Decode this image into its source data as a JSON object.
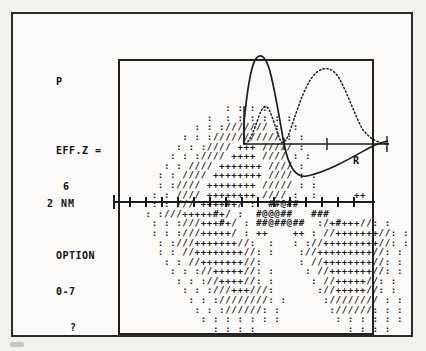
{
  "screen": {
    "background_color": "#f2f1ee",
    "ink_color": "#1b1b1b"
  },
  "readout": {
    "orbital_label": "P",
    "eff_z_label": "EFF.Z =",
    "eff_z_value": "6",
    "option_label": "OPTION",
    "option_range": "0-7",
    "prompt": "?"
  },
  "scale": {
    "nm_label": "2 NM"
  },
  "inset": {
    "axis_label": "R",
    "solid_curve_name": "radial-wavefunction",
    "dotted_curve_name": "radial-probability-density"
  },
  "ascii_plot": {
    "name": "orbital-density-ascii",
    "rows": [
      "                 : : : :",
      "              :  : : : : : :",
      "            : : ://///// :  :",
      "          : : ://///////// : :",
      "         : : ://// +++ ///// :",
      "        : : ://// ++++ //// : :",
      "       : : //// +++++++ //// :",
      "      : : //// ++++++++ //// : :",
      "      : ://// ++++++++ ///// : :",
      "     : : //// ++++++++ //// :  :      ++",
      "     : : /// ++++#+/ :  ##@##",
      "    : :///+++++#+/ :  #@@@##   ###",
      "     : : :///+++#+/ : ##@##@##  :/+#+++//: :",
      "     : : :///+++++/ : ++    ++ : //+++++++//: :",
      "      : :///+++++++//:  :   : ://+++++++++//: :",
      "      : : //++++++++//: :    ://+++++++++//: :",
      "       : : //+++++++//:      : //++++++++//: :",
      "        : : ://+++++//: :     : //+++++++//: :",
      "         : : ://++++//: :      : //+++++//: :",
      "          : : :///+++///:       ://+++++//: :",
      "           : : :////////: :      ://////// : :",
      "            : : ://////: :        ://////: : :",
      "             : : : : : : :         : : : : : :",
      "               : : : :               : : : :"
    ]
  }
}
